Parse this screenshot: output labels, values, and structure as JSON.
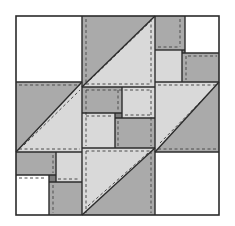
{
  "diagram": {
    "type": "quilt-block",
    "colors": {
      "gray": "#aaaaaa",
      "light": "#d9d9d9",
      "white": "#ffffff",
      "dark": "#7d7d7d",
      "outline": "#2b2b2b",
      "stitch": "#4d4d4d"
    },
    "border": {
      "x": 16,
      "y": 16,
      "w": 203,
      "h": 199
    },
    "rects": [
      {
        "name": "patch-top-left-white",
        "x": 16,
        "y": 16,
        "w": 66,
        "h": 66,
        "fill": "white"
      },
      {
        "name": "patch-top-right-gray",
        "x": 155,
        "y": 16,
        "w": 30,
        "h": 34,
        "fill": "gray"
      },
      {
        "name": "patch-top-right-white",
        "x": 185,
        "y": 16,
        "w": 34,
        "h": 37,
        "fill": "white"
      },
      {
        "name": "patch-top-right-light",
        "x": 155,
        "y": 50,
        "w": 27,
        "h": 32,
        "fill": "light"
      },
      {
        "name": "patch-top-right-gray-2",
        "x": 182,
        "y": 53,
        "w": 37,
        "h": 29,
        "fill": "gray"
      },
      {
        "name": "patch-top-right-dark",
        "x": 182,
        "y": 50,
        "w": 3,
        "h": 3,
        "fill": "dark"
      },
      {
        "name": "patch-center-gray-1",
        "x": 82,
        "y": 87,
        "w": 40,
        "h": 26,
        "fill": "gray"
      },
      {
        "name": "patch-center-light-1",
        "x": 122,
        "y": 87,
        "w": 33,
        "h": 31,
        "fill": "light"
      },
      {
        "name": "patch-center-light-2",
        "x": 82,
        "y": 113,
        "w": 33,
        "h": 35,
        "fill": "light"
      },
      {
        "name": "patch-center-gray-2",
        "x": 115,
        "y": 118,
        "w": 40,
        "h": 30,
        "fill": "gray"
      },
      {
        "name": "patch-center-dark",
        "x": 115,
        "y": 113,
        "w": 7,
        "h": 5,
        "fill": "dark"
      },
      {
        "name": "patch-bottom-left-gray",
        "x": 16,
        "y": 152,
        "w": 40,
        "h": 23,
        "fill": "gray"
      },
      {
        "name": "patch-bottom-left-light",
        "x": 56,
        "y": 152,
        "w": 26,
        "h": 30,
        "fill": "light"
      },
      {
        "name": "patch-bottom-left-white",
        "x": 16,
        "y": 175,
        "w": 33,
        "h": 40,
        "fill": "white"
      },
      {
        "name": "patch-bottom-left-gray-2",
        "x": 49,
        "y": 182,
        "w": 33,
        "h": 33,
        "fill": "gray"
      },
      {
        "name": "patch-bottom-left-dark",
        "x": 49,
        "y": 175,
        "w": 7,
        "h": 7,
        "fill": "dark"
      },
      {
        "name": "patch-bottom-right-white",
        "x": 155,
        "y": 152,
        "w": 64,
        "h": 63,
        "fill": "white"
      }
    ],
    "triangles": [
      {
        "name": "hst-top-gray",
        "points": "82,16 155,16 82,87",
        "fill": "gray"
      },
      {
        "name": "hst-top-light",
        "points": "155,16 155,87 82,87",
        "fill": "light"
      },
      {
        "name": "hst-left-gray",
        "points": "16,82 82,82 16,152",
        "fill": "gray"
      },
      {
        "name": "hst-left-light",
        "points": "82,82 82,152 16,152",
        "fill": "light"
      },
      {
        "name": "hst-right-light",
        "points": "155,82 219,82 155,152",
        "fill": "light"
      },
      {
        "name": "hst-right-gray",
        "points": "219,82 219,152 155,152",
        "fill": "gray"
      },
      {
        "name": "hst-bottom-light",
        "points": "82,148 155,148 82,215",
        "fill": "light"
      },
      {
        "name": "hst-bottom-gray",
        "points": "155,148 155,215 82,215",
        "fill": "gray"
      }
    ],
    "seams": [
      {
        "x1": 82,
        "y1": 16,
        "x2": 82,
        "y2": 215
      },
      {
        "x1": 155,
        "y1": 16,
        "x2": 155,
        "y2": 215
      },
      {
        "x1": 16,
        "y1": 82,
        "x2": 82,
        "y2": 82
      },
      {
        "x1": 155,
        "y1": 82,
        "x2": 219,
        "y2": 82
      },
      {
        "x1": 16,
        "y1": 152,
        "x2": 82,
        "y2": 152
      },
      {
        "x1": 155,
        "y1": 152,
        "x2": 219,
        "y2": 152
      },
      {
        "x1": 82,
        "y1": 87,
        "x2": 155,
        "y2": 87
      },
      {
        "x1": 82,
        "y1": 148,
        "x2": 155,
        "y2": 148
      },
      {
        "x1": 155,
        "y1": 50,
        "x2": 185,
        "y2": 50
      },
      {
        "x1": 182,
        "y1": 53,
        "x2": 219,
        "y2": 53
      },
      {
        "x1": 185,
        "y1": 16,
        "x2": 185,
        "y2": 53
      },
      {
        "x1": 182,
        "y1": 50,
        "x2": 182,
        "y2": 82
      },
      {
        "x1": 82,
        "y1": 113,
        "x2": 122,
        "y2": 113
      },
      {
        "x1": 115,
        "y1": 118,
        "x2": 155,
        "y2": 118
      },
      {
        "x1": 122,
        "y1": 87,
        "x2": 122,
        "y2": 118
      },
      {
        "x1": 115,
        "y1": 113,
        "x2": 115,
        "y2": 148
      },
      {
        "x1": 16,
        "y1": 175,
        "x2": 56,
        "y2": 175
      },
      {
        "x1": 49,
        "y1": 182,
        "x2": 82,
        "y2": 182
      },
      {
        "x1": 56,
        "y1": 152,
        "x2": 56,
        "y2": 182
      },
      {
        "x1": 49,
        "y1": 175,
        "x2": 49,
        "y2": 215
      },
      {
        "x1": 82,
        "y1": 87,
        "x2": 155,
        "y2": 16
      },
      {
        "x1": 16,
        "y1": 152,
        "x2": 82,
        "y2": 82
      },
      {
        "x1": 155,
        "y1": 152,
        "x2": 219,
        "y2": 82
      },
      {
        "x1": 82,
        "y1": 215,
        "x2": 155,
        "y2": 148
      }
    ],
    "stitches": [
      {
        "x1": 86,
        "y1": 19,
        "x2": 86,
        "y2": 84
      },
      {
        "x1": 151,
        "y1": 19,
        "x2": 151,
        "y2": 84
      },
      {
        "x1": 86,
        "y1": 84,
        "x2": 151,
        "y2": 84
      },
      {
        "x1": 90,
        "y1": 80,
        "x2": 150,
        "y2": 22
      },
      {
        "x1": 19,
        "y1": 85,
        "x2": 80,
        "y2": 85
      },
      {
        "x1": 19,
        "y1": 149,
        "x2": 80,
        "y2": 149
      },
      {
        "x1": 24,
        "y1": 145,
        "x2": 80,
        "y2": 90
      },
      {
        "x1": 158,
        "y1": 85,
        "x2": 217,
        "y2": 85
      },
      {
        "x1": 158,
        "y1": 149,
        "x2": 217,
        "y2": 149
      },
      {
        "x1": 160,
        "y1": 143,
        "x2": 214,
        "y2": 88
      },
      {
        "x1": 86,
        "y1": 151,
        "x2": 86,
        "y2": 213
      },
      {
        "x1": 151,
        "y1": 151,
        "x2": 151,
        "y2": 213
      },
      {
        "x1": 86,
        "y1": 151,
        "x2": 151,
        "y2": 151
      },
      {
        "x1": 88,
        "y1": 206,
        "x2": 148,
        "y2": 153
      },
      {
        "x1": 86,
        "y1": 90,
        "x2": 86,
        "y2": 146
      },
      {
        "x1": 151,
        "y1": 90,
        "x2": 151,
        "y2": 146
      },
      {
        "x1": 86,
        "y1": 90,
        "x2": 151,
        "y2": 90
      },
      {
        "x1": 86,
        "y1": 116,
        "x2": 113,
        "y2": 116
      },
      {
        "x1": 125,
        "y1": 115,
        "x2": 151,
        "y2": 115
      },
      {
        "x1": 118,
        "y1": 90,
        "x2": 118,
        "y2": 110
      },
      {
        "x1": 118,
        "y1": 121,
        "x2": 118,
        "y2": 146
      },
      {
        "x1": 158,
        "y1": 47,
        "x2": 180,
        "y2": 47
      },
      {
        "x1": 188,
        "y1": 56,
        "x2": 217,
        "y2": 56
      },
      {
        "x1": 180,
        "y1": 19,
        "x2": 180,
        "y2": 47
      },
      {
        "x1": 186,
        "y1": 56,
        "x2": 186,
        "y2": 80
      },
      {
        "x1": 19,
        "y1": 178,
        "x2": 46,
        "y2": 178
      },
      {
        "x1": 58,
        "y1": 179,
        "x2": 80,
        "y2": 179
      },
      {
        "x1": 53,
        "y1": 185,
        "x2": 53,
        "y2": 213
      },
      {
        "x1": 53,
        "y1": 155,
        "x2": 53,
        "y2": 173
      }
    ]
  }
}
